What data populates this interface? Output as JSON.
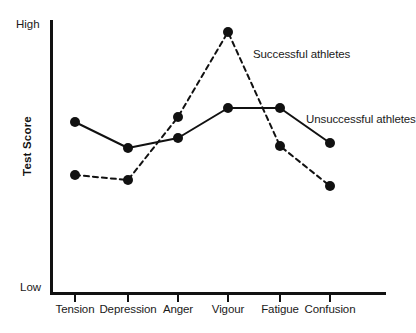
{
  "chart_data": {
    "type": "line",
    "title": "",
    "xlabel": "",
    "ylabel": "Test Score",
    "categories": [
      "Tension",
      "Depression",
      "Anger",
      "Vigour",
      "Fatigue",
      "Confusion"
    ],
    "y_axis": {
      "min_label": "Low",
      "max_label": "High",
      "grid": false,
      "ticks": []
    },
    "x_axis": {
      "grid": false
    },
    "legend": {
      "position": "inline-annotation",
      "entries": [
        "Successful athletes",
        "Unsuccessful athletes"
      ]
    },
    "series": [
      {
        "name": "Successful athletes",
        "style": "dashed",
        "color": "#111111",
        "marker": "filled-circle",
        "values": [
          33,
          27,
          62,
          100,
          48,
          22
        ],
        "points_px": [
          {
            "x": 75,
            "y": 175
          },
          {
            "x": 128,
            "y": 180
          },
          {
            "x": 178,
            "y": 117
          },
          {
            "x": 228,
            "y": 32
          },
          {
            "x": 280,
            "y": 146
          },
          {
            "x": 330,
            "y": 186
          }
        ]
      },
      {
        "name": "Unsuccessful athletes",
        "style": "solid",
        "color": "#111111",
        "marker": "filled-circle",
        "values": [
          53,
          43,
          55,
          74,
          74,
          59
        ],
        "points_px": [
          {
            "x": 75,
            "y": 122
          },
          {
            "x": 128,
            "y": 148
          },
          {
            "x": 178,
            "y": 138
          },
          {
            "x": 228,
            "y": 108
          },
          {
            "x": 280,
            "y": 108
          },
          {
            "x": 330,
            "y": 143
          }
        ]
      }
    ],
    "annotations": [
      {
        "text": "Successful athletes",
        "x": 253,
        "y": 48
      },
      {
        "text": "Unsuccessful athletes",
        "x": 306,
        "y": 113
      }
    ],
    "ticks_px": [
      75,
      128,
      178,
      228,
      280,
      330
    ],
    "colors": {
      "ink": "#111111",
      "background": "#ffffff"
    }
  }
}
